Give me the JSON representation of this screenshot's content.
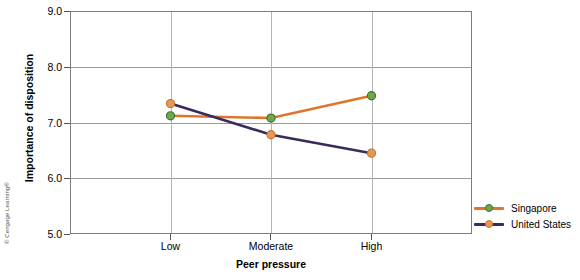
{
  "chart_data": {
    "type": "line",
    "title": "",
    "xlabel": "Peer pressure",
    "ylabel": "Importance of disposition",
    "categories": [
      "Low",
      "Moderate",
      "High"
    ],
    "ylim": [
      5.0,
      9.0
    ],
    "ytick_labels": [
      "5.0",
      "6.0",
      "7.0",
      "8.0",
      "9.0"
    ],
    "ytick_values": [
      5.0,
      6.0,
      7.0,
      8.0,
      9.0
    ],
    "grid": true,
    "legend_position": "right-bottom-outside",
    "series": [
      {
        "name": "Singapore",
        "values": [
          7.12,
          7.08,
          7.48
        ],
        "line_color": "#E0762B",
        "marker_color": "#6FA84B",
        "marker_edge_color": "#3F7030"
      },
      {
        "name": "United States",
        "values": [
          7.34,
          6.78,
          6.45
        ],
        "line_color": "#3B2A5C",
        "marker_color": "#E09A55",
        "marker_edge_color": "#C9762C"
      }
    ]
  },
  "axes": {
    "frame_color": "#7d7d7d",
    "gridline_color": "#9a9a9a"
  },
  "legend": {
    "entries": [
      {
        "label": "Singapore"
      },
      {
        "label": "United States"
      }
    ]
  },
  "credit": {
    "text": "© Cengage Learning®"
  }
}
